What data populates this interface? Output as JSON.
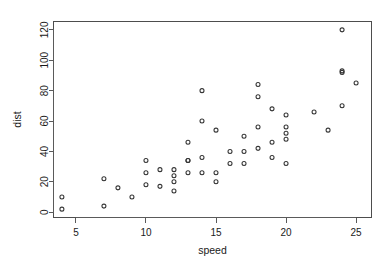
{
  "figure": {
    "width": 385,
    "height": 270,
    "background_color": "#ffffff",
    "frame_color": "#4d4d4d",
    "point_color": "#333333",
    "text_color": "#1a1a1a"
  },
  "chart_data": {
    "type": "scatter",
    "title": "",
    "xlabel": "speed",
    "ylabel": "dist",
    "xlim": [
      3.4,
      26.1
    ],
    "ylim": [
      -3.5,
      125.5
    ],
    "xticks": [
      5,
      10,
      15,
      20,
      25
    ],
    "yticks": [
      0,
      20,
      40,
      60,
      80,
      100,
      120
    ],
    "xtick_labels": [
      "5",
      "10",
      "15",
      "20",
      "25"
    ],
    "ytick_labels": [
      "0",
      "20",
      "40",
      "60",
      "80",
      "100",
      "120"
    ],
    "grid": false,
    "legend": null,
    "marker": "open-circle",
    "marker_size": 4,
    "n_points": 50,
    "x": [
      4,
      4,
      7,
      7,
      8,
      9,
      10,
      10,
      10,
      11,
      11,
      12,
      12,
      12,
      12,
      13,
      13,
      13,
      13,
      14,
      14,
      14,
      14,
      15,
      15,
      15,
      16,
      16,
      17,
      17,
      17,
      18,
      18,
      18,
      18,
      19,
      19,
      19,
      20,
      20,
      20,
      20,
      20,
      22,
      23,
      24,
      24,
      24,
      24,
      25
    ],
    "y": [
      2,
      10,
      4,
      22,
      16,
      10,
      18,
      26,
      34,
      17,
      28,
      14,
      20,
      24,
      28,
      26,
      34,
      34,
      46,
      26,
      36,
      60,
      80,
      20,
      26,
      54,
      32,
      40,
      32,
      40,
      50,
      42,
      56,
      76,
      84,
      36,
      46,
      68,
      32,
      48,
      52,
      56,
      64,
      66,
      54,
      70,
      92,
      93,
      120,
      85
    ],
    "points": [
      {
        "speed": 4,
        "dist": 2
      },
      {
        "speed": 4,
        "dist": 10
      },
      {
        "speed": 7,
        "dist": 4
      },
      {
        "speed": 7,
        "dist": 22
      },
      {
        "speed": 8,
        "dist": 16
      },
      {
        "speed": 9,
        "dist": 10
      },
      {
        "speed": 10,
        "dist": 18
      },
      {
        "speed": 10,
        "dist": 26
      },
      {
        "speed": 10,
        "dist": 34
      },
      {
        "speed": 11,
        "dist": 17
      },
      {
        "speed": 11,
        "dist": 28
      },
      {
        "speed": 12,
        "dist": 14
      },
      {
        "speed": 12,
        "dist": 20
      },
      {
        "speed": 12,
        "dist": 24
      },
      {
        "speed": 12,
        "dist": 28
      },
      {
        "speed": 13,
        "dist": 26
      },
      {
        "speed": 13,
        "dist": 34
      },
      {
        "speed": 13,
        "dist": 34
      },
      {
        "speed": 13,
        "dist": 46
      },
      {
        "speed": 14,
        "dist": 26
      },
      {
        "speed": 14,
        "dist": 36
      },
      {
        "speed": 14,
        "dist": 60
      },
      {
        "speed": 14,
        "dist": 80
      },
      {
        "speed": 15,
        "dist": 20
      },
      {
        "speed": 15,
        "dist": 26
      },
      {
        "speed": 15,
        "dist": 54
      },
      {
        "speed": 16,
        "dist": 32
      },
      {
        "speed": 16,
        "dist": 40
      },
      {
        "speed": 17,
        "dist": 32
      },
      {
        "speed": 17,
        "dist": 40
      },
      {
        "speed": 17,
        "dist": 50
      },
      {
        "speed": 18,
        "dist": 42
      },
      {
        "speed": 18,
        "dist": 56
      },
      {
        "speed": 18,
        "dist": 76
      },
      {
        "speed": 18,
        "dist": 84
      },
      {
        "speed": 19,
        "dist": 36
      },
      {
        "speed": 19,
        "dist": 46
      },
      {
        "speed": 19,
        "dist": 68
      },
      {
        "speed": 20,
        "dist": 32
      },
      {
        "speed": 20,
        "dist": 48
      },
      {
        "speed": 20,
        "dist": 52
      },
      {
        "speed": 20,
        "dist": 56
      },
      {
        "speed": 20,
        "dist": 64
      },
      {
        "speed": 22,
        "dist": 66
      },
      {
        "speed": 23,
        "dist": 54
      },
      {
        "speed": 24,
        "dist": 70
      },
      {
        "speed": 24,
        "dist": 92
      },
      {
        "speed": 24,
        "dist": 93
      },
      {
        "speed": 24,
        "dist": 120
      },
      {
        "speed": 25,
        "dist": 85
      }
    ]
  }
}
